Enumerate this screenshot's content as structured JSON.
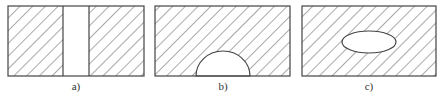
{
  "figure": {
    "panels": [
      {
        "id": "a",
        "label": "a)",
        "cutout": "vertical rectangular slot through center",
        "stroke": "#444444",
        "hatch": "#555555"
      },
      {
        "id": "b",
        "label": "b)",
        "cutout": "semicircular notch on bottom edge",
        "stroke": "#444444",
        "hatch": "#555555"
      },
      {
        "id": "c",
        "label": "c)",
        "cutout": "elliptical hole in center",
        "stroke": "#444444",
        "hatch": "#555555"
      }
    ]
  }
}
